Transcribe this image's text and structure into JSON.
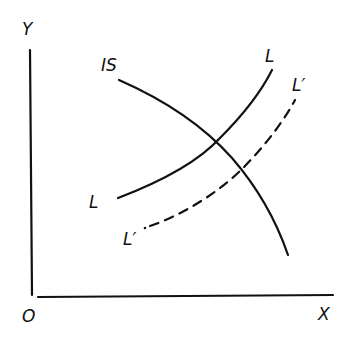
{
  "diagram": {
    "type": "IS-LM style economics diagram",
    "colors": {
      "ink": "#111111",
      "background": "#ffffff"
    },
    "axes": {
      "y_label": "Y",
      "x_label": "X",
      "origin_label": "O"
    },
    "curves": [
      {
        "id": "IS",
        "label": "IS",
        "style": "solid",
        "shape": "downward-sloping, concave"
      },
      {
        "id": "L",
        "label_top": "L",
        "label_bottom": "L",
        "style": "solid",
        "shape": "upward-sloping, convex"
      },
      {
        "id": "L_prime",
        "label_top": "L′",
        "label_bottom": "L′",
        "style": "dashed",
        "shape": "upward-sloping, shifted right of L"
      }
    ],
    "intersections": [
      {
        "curves": [
          "IS",
          "L"
        ]
      },
      {
        "curves": [
          "IS",
          "L_prime"
        ]
      }
    ]
  }
}
